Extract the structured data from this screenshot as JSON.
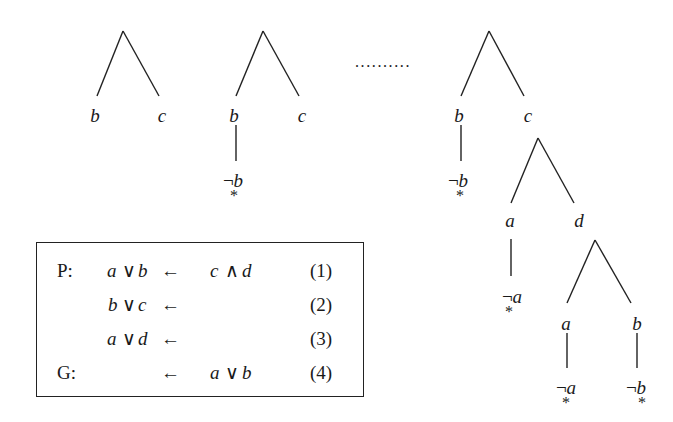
{
  "figure": {
    "ellipsis": "..........",
    "trees": [
      {
        "id": "tree-1",
        "leaves": [
          {
            "label": "b"
          },
          {
            "label": "c"
          }
        ]
      },
      {
        "id": "tree-2",
        "leaves": [
          {
            "label": "b",
            "child": {
              "neg": "¬",
              "label": "b",
              "mark": "*"
            }
          },
          {
            "label": "c"
          }
        ]
      },
      {
        "id": "tree-3",
        "leaves": [
          {
            "label": "b",
            "child": {
              "neg": "¬",
              "label": "b",
              "mark": "*"
            }
          },
          {
            "label": "c",
            "children": [
              {
                "label": "a",
                "child": {
                  "neg": "¬",
                  "label": "a",
                  "mark": "*"
                }
              },
              {
                "label": "d",
                "children": [
                  {
                    "label": "a",
                    "child": {
                      "neg": "¬",
                      "label": "a",
                      "mark": "*"
                    }
                  },
                  {
                    "label": "b",
                    "child": {
                      "neg": "¬",
                      "label": "b",
                      "mark": "*"
                    }
                  }
                ]
              }
            ]
          }
        ]
      }
    ]
  },
  "program": {
    "rows": [
      {
        "prefix": "P:",
        "head_a": "a",
        "head_op": "∨",
        "head_b": "b",
        "arrow": "←",
        "body_a": "c",
        "body_op": "∧",
        "body_b": "d",
        "num": "(1)"
      },
      {
        "prefix": "",
        "head_a": "b",
        "head_op": "∨",
        "head_b": "c",
        "arrow": "←",
        "body_a": "",
        "body_op": "",
        "body_b": "",
        "num": "(2)"
      },
      {
        "prefix": "",
        "head_a": "a",
        "head_op": "∨",
        "head_b": "d",
        "arrow": "←",
        "body_a": "",
        "body_op": "",
        "body_b": "",
        "num": "(3)"
      },
      {
        "prefix": "G:",
        "head_a": "",
        "head_op": "",
        "head_b": "",
        "arrow": "←",
        "body_a": "a",
        "body_op": "∨",
        "body_b": "b",
        "num": "(4)"
      }
    ]
  }
}
